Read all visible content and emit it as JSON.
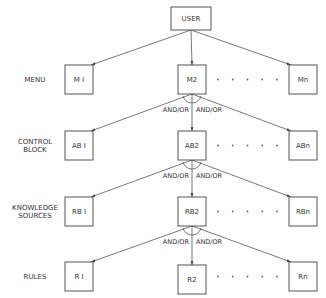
{
  "diagram": {
    "root": {
      "id": "user",
      "label": "USER"
    },
    "levels": [
      {
        "id": "menu",
        "label_lines": [
          "MENU"
        ],
        "nodes": [
          {
            "id": "m1",
            "label": "M I"
          },
          {
            "id": "m2",
            "label": "M2"
          },
          {
            "id": "mn",
            "label": "Mn"
          }
        ],
        "relation_from_parent": null
      },
      {
        "id": "control-block",
        "label_lines": [
          "CONTROL",
          "BLOCK"
        ],
        "nodes": [
          {
            "id": "ab1",
            "label": "AB I"
          },
          {
            "id": "ab2",
            "label": "AB2"
          },
          {
            "id": "abn",
            "label": "ABn"
          }
        ],
        "relation_from_parent": {
          "left": "AND/OR",
          "right": "AND/OR"
        }
      },
      {
        "id": "knowledge-sources",
        "label_lines": [
          "KNOWLEDGE",
          "SOURCES"
        ],
        "nodes": [
          {
            "id": "rb1",
            "label": "RB I"
          },
          {
            "id": "rb2",
            "label": "RB2"
          },
          {
            "id": "rbn",
            "label": "RBn"
          }
        ],
        "relation_from_parent": {
          "left": "AND/OR",
          "right": "AND/OR"
        }
      },
      {
        "id": "rules",
        "label_lines": [
          "RULES"
        ],
        "nodes": [
          {
            "id": "r1",
            "label": "R I"
          },
          {
            "id": "r2",
            "label": "R2"
          },
          {
            "id": "rn",
            "label": "Rn"
          }
        ],
        "relation_from_parent": {
          "left": "AND/OR",
          "right": "AND/OR"
        }
      }
    ],
    "ellipsis_dot_count": 5,
    "edges": [
      [
        "user",
        "m1"
      ],
      [
        "user",
        "m2"
      ],
      [
        "user",
        "mn"
      ],
      [
        "m2",
        "ab1"
      ],
      [
        "m2",
        "ab2"
      ],
      [
        "m2",
        "abn"
      ],
      [
        "ab2",
        "rb1"
      ],
      [
        "ab2",
        "rb2"
      ],
      [
        "ab2",
        "rbn"
      ],
      [
        "rb2",
        "r1"
      ],
      [
        "rb2",
        "r2"
      ],
      [
        "rb2",
        "rn"
      ]
    ]
  }
}
